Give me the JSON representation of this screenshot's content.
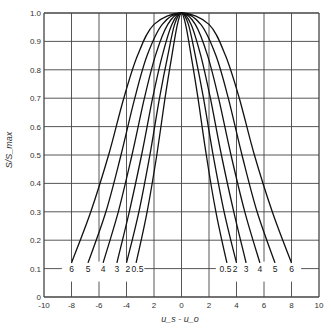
{
  "chart_data": {
    "type": "line",
    "title": "",
    "xlabel": "u_s - u_o",
    "ylabel": "S/S_max",
    "xlim": [
      -10,
      10
    ],
    "ylim": [
      0,
      1.0
    ],
    "grid": true,
    "x_ticks": [
      -10,
      -8,
      -6,
      -4,
      -2,
      0,
      2,
      4,
      6,
      8,
      10
    ],
    "x_tick_labels": [
      "-10",
      "-8",
      "-6",
      "-4",
      "2",
      "0",
      "2",
      "4",
      "6",
      "8",
      "10"
    ],
    "y_ticks": [
      0,
      0.1,
      0.2,
      0.3,
      0.4,
      0.5,
      0.6,
      0.7,
      0.8,
      0.9,
      1.0
    ],
    "y_tick_labels": [
      "0",
      "0.1",
      "0.2",
      "0.3",
      "0.4",
      "0.5",
      "0.6",
      "0.7",
      "0.8",
      "0.9",
      "1.0"
    ],
    "curve_label_y": 0.1,
    "series": [
      {
        "name": "0.5",
        "label": "0.5",
        "x": [
          -3.3,
          -2.5,
          -1.8,
          -1.2,
          -0.7,
          -0.3,
          0,
          0.3,
          0.7,
          1.2,
          1.8,
          2.5,
          3.3
        ],
        "y": [
          0.12,
          0.3,
          0.5,
          0.7,
          0.85,
          0.96,
          1.0,
          0.96,
          0.85,
          0.7,
          0.5,
          0.3,
          0.12
        ]
      },
      {
        "name": "2",
        "label": "2",
        "x": [
          -4.0,
          -3.1,
          -2.3,
          -1.6,
          -1.0,
          -0.5,
          0,
          0.5,
          1.0,
          1.6,
          2.3,
          3.1,
          4.0
        ],
        "y": [
          0.12,
          0.3,
          0.5,
          0.7,
          0.85,
          0.96,
          1.0,
          0.96,
          0.85,
          0.7,
          0.5,
          0.3,
          0.12
        ]
      },
      {
        "name": "3",
        "label": "3",
        "x": [
          -4.7,
          -3.8,
          -2.9,
          -2.1,
          -1.4,
          -0.7,
          0,
          0.7,
          1.4,
          2.1,
          2.9,
          3.8,
          4.7
        ],
        "y": [
          0.12,
          0.3,
          0.5,
          0.7,
          0.85,
          0.96,
          1.0,
          0.96,
          0.85,
          0.7,
          0.5,
          0.3,
          0.12
        ]
      },
      {
        "name": "4",
        "label": "4",
        "x": [
          -5.7,
          -4.6,
          -3.6,
          -2.7,
          -1.9,
          -1.0,
          0,
          1.0,
          1.9,
          2.7,
          3.6,
          4.6,
          5.7
        ],
        "y": [
          0.12,
          0.3,
          0.5,
          0.7,
          0.85,
          0.96,
          1.0,
          0.96,
          0.85,
          0.7,
          0.5,
          0.3,
          0.12
        ]
      },
      {
        "name": "5",
        "label": "5",
        "x": [
          -6.8,
          -5.5,
          -4.4,
          -3.4,
          -2.5,
          -1.4,
          0,
          1.4,
          2.5,
          3.4,
          4.4,
          5.5,
          6.8
        ],
        "y": [
          0.12,
          0.3,
          0.5,
          0.7,
          0.85,
          0.96,
          1.0,
          0.96,
          0.85,
          0.7,
          0.5,
          0.3,
          0.12
        ]
      },
      {
        "name": "6",
        "label": "6",
        "x": [
          -8.0,
          -6.6,
          -5.3,
          -4.2,
          -3.2,
          -2.0,
          0,
          2.0,
          3.2,
          4.2,
          5.3,
          6.6,
          8.0
        ],
        "y": [
          0.12,
          0.3,
          0.5,
          0.7,
          0.85,
          0.96,
          1.0,
          0.96,
          0.85,
          0.7,
          0.5,
          0.3,
          0.12
        ]
      }
    ],
    "left_labels": [
      "6",
      "5",
      "4",
      "3",
      "2",
      "0.5"
    ],
    "right_labels": [
      "0.5",
      "2",
      "3",
      "4",
      "5",
      "6"
    ]
  }
}
